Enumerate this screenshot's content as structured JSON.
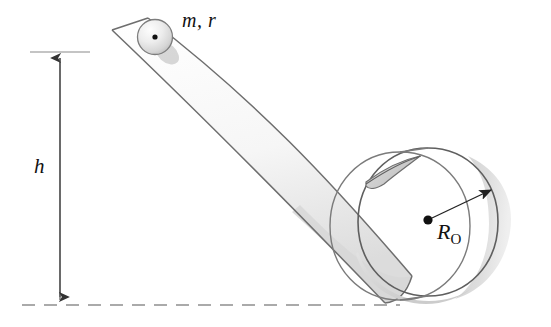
{
  "figure": {
    "background_color": "#ffffff",
    "width": 551,
    "height": 327,
    "line_color": "#6e6e6e",
    "dark_line_color": "#4a4a4a",
    "shade_color": "#d9d9d9",
    "shade_color_dark": "#c4c4c4",
    "text_color": "#111111"
  },
  "labels": {
    "height": "h",
    "ball": "m, r",
    "loop_radius_symbol": "R",
    "loop_radius_subscript": "O"
  },
  "annotations": {
    "height_dimension": {
      "name": "h",
      "orientation": "vertical",
      "double_headed": true,
      "x": 60,
      "y_top": 52,
      "y_bottom": 303,
      "tick_top_y": 52,
      "tick_bottom_y": 305
    },
    "ground_line": {
      "style": "dashed",
      "y": 305,
      "x_start": 22,
      "x_end": 400
    },
    "radius_arrow": {
      "from_x": 428,
      "from_y": 220,
      "to_x": 492,
      "to_y": 190,
      "arrowhead": true
    }
  },
  "objects": {
    "ball": {
      "name": "ball",
      "center_x": 155,
      "center_y": 37,
      "radius": 17,
      "has_center_dot": true,
      "shaded": true
    },
    "ramp": {
      "name": "inclined-ramp",
      "description": "straight inclined ribbon curving into the loop at the bottom",
      "top_x": 112,
      "top_y": 30,
      "bottom_x": 400,
      "bottom_y": 300
    },
    "loop": {
      "name": "circular-loop",
      "center_x": 428,
      "center_y": 220,
      "radius": 72,
      "perspective": "cylindrical-3d",
      "has_center_dot": true
    }
  }
}
